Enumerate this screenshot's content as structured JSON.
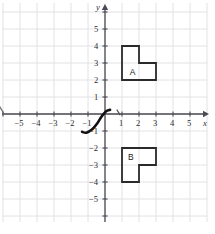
{
  "figure": {
    "type": "coordinate-plane",
    "background_color": "#ffffff",
    "grid_color": "#e2e2e6",
    "axis_color": "#4a4a52",
    "shape_stroke_color": "#2a2a2a",
    "curve_color": "#111111",
    "label_color": "#2b2b2b"
  },
  "axes": {
    "x_axis_label": "x",
    "y_axis_label": "y",
    "x_ticks": [
      "−5",
      "−4",
      "−3",
      "−2",
      "−1",
      "1",
      "2",
      "3",
      "4",
      "5"
    ],
    "y_ticks": [
      "5",
      "4",
      "3",
      "2",
      "1",
      "−1",
      "−2",
      "−3",
      "−4",
      "−5"
    ],
    "x_range": [
      -6,
      6
    ],
    "y_range": [
      -6,
      6
    ],
    "grid": true,
    "x_arrow": true,
    "y_arrow": true
  },
  "chart_data": {
    "type": "scatter",
    "title": "",
    "xlabel": "x",
    "ylabel": "y",
    "xlim": [
      -6,
      6
    ],
    "ylim": [
      -6,
      6
    ],
    "grid": true,
    "legend": "none",
    "shapes": [
      {
        "name": "A",
        "label": "A",
        "label_point": [
          1.45,
          2.45
        ],
        "vertices": [
          [
            1,
            4
          ],
          [
            2,
            4
          ],
          [
            2,
            3
          ],
          [
            3,
            3
          ],
          [
            3,
            2
          ],
          [
            1,
            2
          ]
        ],
        "closed": true,
        "fill": "none",
        "stroke": "#2a2a2a"
      },
      {
        "name": "B",
        "label": "B",
        "label_point": [
          1.35,
          -2.55
        ],
        "vertices": [
          [
            1,
            -2
          ],
          [
            3,
            -2
          ],
          [
            3,
            -3
          ],
          [
            2,
            -3
          ],
          [
            2,
            -4
          ],
          [
            1,
            -4
          ]
        ],
        "closed": true,
        "fill": "none",
        "stroke": "#2a2a2a"
      }
    ],
    "curves": [
      {
        "name": "cubic-like-curve",
        "description": "thick dark curve through third quadrant rising to origin",
        "points": [
          [
            -1.35,
            -1.05
          ],
          [
            -1.1,
            -1.1
          ],
          [
            -0.75,
            -0.9
          ],
          [
            -0.45,
            -0.55
          ],
          [
            -0.2,
            -0.15
          ],
          [
            0.05,
            0.15
          ],
          [
            0.3,
            0.25
          ]
        ],
        "stroke": "#111111",
        "stroke_width": 2.6
      },
      {
        "name": "left-edge-curve-fragment",
        "description": "small curve fragment entering at left edge above x-axis",
        "points": [
          [
            -6.2,
            0.45
          ],
          [
            -6.05,
            0.2
          ],
          [
            -5.95,
            0.02
          ]
        ],
        "stroke": "#6a6a70",
        "stroke_width": 1.2
      }
    ],
    "tick_marks": [
      {
        "name": "stray-tick-near-x-1",
        "point": [
          0.78,
          0.05
        ]
      }
    ]
  }
}
